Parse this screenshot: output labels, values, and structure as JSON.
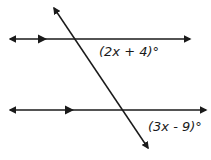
{
  "diagram": {
    "type": "parallel-lines-cut-by-transversal",
    "stroke_color": "#1a1a1a",
    "background": "#ffffff",
    "lines": [
      {
        "name": "top-parallel-line",
        "x1": 7,
        "y1": 39,
        "x2": 193,
        "y2": 39,
        "arrows": "both",
        "parallel_marker_x": 43
      },
      {
        "name": "bottom-parallel-line",
        "x1": 7,
        "y1": 110,
        "x2": 209,
        "y2": 110,
        "arrows": "both",
        "parallel_marker_x": 71
      },
      {
        "name": "transversal",
        "x1": 52,
        "y1": 5,
        "x2": 150,
        "y2": 151,
        "arrows": "both"
      }
    ],
    "angles": [
      {
        "label": "(2x + 4)°",
        "position": "below-right of top intersection"
      },
      {
        "label": "(3x - 9)°",
        "position": "below-right of bottom intersection"
      }
    ]
  }
}
